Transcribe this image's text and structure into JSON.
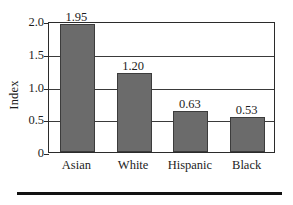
{
  "chart_data": {
    "type": "bar",
    "title": "",
    "subtitle": "",
    "xlabel": "",
    "ylabel": "Index",
    "categories": [
      "Asian",
      "White",
      "Hispanic",
      "Black"
    ],
    "values": [
      1.95,
      1.2,
      0.63,
      0.53
    ],
    "value_labels": [
      "1.95",
      "1.20",
      "0.63",
      "0.53"
    ],
    "series": [
      {
        "name": "Index",
        "values": [
          1.95,
          1.2,
          0.63,
          0.53
        ]
      }
    ],
    "ylim": [
      0,
      2.0
    ],
    "yticks": [
      0,
      0.5,
      1.0,
      1.5,
      2.0
    ],
    "ytick_labels": [
      "0",
      "0.5",
      "1.0",
      "1.5",
      "2.0"
    ],
    "grid": true,
    "grid_axis": "y",
    "legend": false,
    "legend_position": "none",
    "annotations": [],
    "bar_color": "#6b6b6b",
    "bar_edge_color": "#3c3c3c",
    "frame_color": "#2b2b2b",
    "background_color": "#ffffff",
    "text_color": "#1d1d1d"
  },
  "figure": {
    "bottom_rule_color": "#111111"
  }
}
